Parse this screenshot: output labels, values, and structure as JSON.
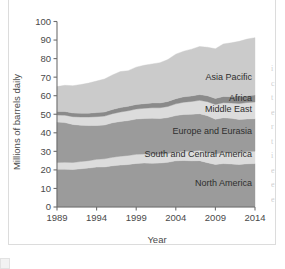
{
  "figure": {
    "name": "world-oil-consumption-stacked-area-chart"
  },
  "axes": {
    "y_title": "Millions of barrels daily",
    "x_title": "Year",
    "y_ticks": [
      "0",
      "10",
      "20",
      "30",
      "40",
      "50",
      "60",
      "70",
      "80",
      "90",
      "100"
    ],
    "x_ticks": [
      "1989",
      "1994",
      "1999",
      "2004",
      "2009",
      "2014"
    ]
  },
  "colors": {
    "north_america": "#9b9b9b",
    "south_central_america": "#dcdcdc",
    "europe_eurasia": "#9b9b9b",
    "middle_east": "#dcdcdc",
    "africa": "#8a8a8a",
    "asia_pacific": "#cbcbcb",
    "axis": "#6e6e6e",
    "text": "#3b3b3b",
    "frame": "#dcdcdc"
  },
  "chart_data": {
    "type": "area",
    "stacked": true,
    "title": "",
    "xlabel": "Year",
    "ylabel": "Millions of barrels daily",
    "xlim": [
      1989,
      2014
    ],
    "ylim": [
      0,
      100
    ],
    "grid": false,
    "legend": "inline-labels",
    "x": [
      1989,
      1990,
      1991,
      1992,
      1993,
      1994,
      1995,
      1996,
      1997,
      1998,
      1999,
      2000,
      2001,
      2002,
      2003,
      2004,
      2005,
      2006,
      2007,
      2008,
      2009,
      2010,
      2011,
      2012,
      2013,
      2014
    ],
    "series": [
      {
        "name": "North America",
        "label": "North America",
        "color": "#9b9b9b",
        "values": [
          20.4,
          20.4,
          20.2,
          20.6,
          21.0,
          21.5,
          21.6,
          22.2,
          22.6,
          22.9,
          23.5,
          23.7,
          23.6,
          23.7,
          24.1,
          24.9,
          25.1,
          24.9,
          25.0,
          23.9,
          22.9,
          23.4,
          23.2,
          22.9,
          23.3,
          23.4
        ]
      },
      {
        "name": "South and Central America",
        "label": "South and Central America",
        "color": "#dcdcdc",
        "values": [
          3.6,
          3.7,
          3.8,
          3.9,
          4.0,
          4.2,
          4.4,
          4.6,
          4.8,
          4.9,
          4.9,
          4.9,
          4.9,
          4.8,
          4.7,
          4.8,
          5.0,
          5.2,
          5.5,
          5.7,
          5.7,
          6.0,
          6.2,
          6.4,
          6.6,
          6.7
        ]
      },
      {
        "name": "Europe and Eurasia",
        "label": "Europe and Eurasia",
        "color": "#9b9b9b",
        "values": [
          21.8,
          21.4,
          20.5,
          19.6,
          18.9,
          18.3,
          18.2,
          18.6,
          18.7,
          18.8,
          19.0,
          19.1,
          19.3,
          19.2,
          19.4,
          19.6,
          19.8,
          19.9,
          19.8,
          19.6,
          18.7,
          18.7,
          18.4,
          17.9,
          17.6,
          17.5
        ]
      },
      {
        "name": "Middle East",
        "label": "Middle East",
        "color": "#dcdcdc",
        "values": [
          3.8,
          4.0,
          4.2,
          4.4,
          4.6,
          4.7,
          4.8,
          4.9,
          5.1,
          5.3,
          5.4,
          5.5,
          5.7,
          5.8,
          6.0,
          6.3,
          6.6,
          6.9,
          7.2,
          7.6,
          7.9,
          8.1,
          8.3,
          8.6,
          8.8,
          9.0
        ]
      },
      {
        "name": "Africa",
        "label": "Africa",
        "color": "#8a8a8a",
        "values": [
          1.9,
          2.0,
          2.0,
          2.1,
          2.1,
          2.2,
          2.2,
          2.3,
          2.4,
          2.4,
          2.5,
          2.5,
          2.6,
          2.6,
          2.7,
          2.8,
          2.9,
          3.0,
          3.1,
          3.2,
          3.3,
          3.4,
          3.4,
          3.6,
          3.7,
          3.8
        ]
      },
      {
        "name": "Asia Pacific",
        "label": "Asia Pacific",
        "color": "#cbcbcb",
        "values": [
          13.4,
          14.1,
          14.7,
          15.4,
          16.2,
          17.0,
          17.8,
          18.6,
          19.4,
          19.2,
          20.1,
          20.7,
          21.0,
          21.7,
          22.6,
          24.0,
          24.6,
          25.2,
          25.9,
          26.1,
          26.8,
          28.3,
          29.0,
          29.9,
          30.5,
          30.9
        ]
      }
    ],
    "totals": [
      64.9,
      65.6,
      65.4,
      66.0,
      66.8,
      67.9,
      69.0,
      71.2,
      73.0,
      73.5,
      75.4,
      76.4,
      77.1,
      77.8,
      79.5,
      82.4,
      84.0,
      85.1,
      86.5,
      86.1,
      85.3,
      87.9,
      88.5,
      89.3,
      90.5,
      91.3
    ]
  },
  "right_bleed": [
    "i",
    "c",
    "t",
    "e",
    "r",
    "t",
    "i",
    "e",
    "e",
    "e"
  ]
}
